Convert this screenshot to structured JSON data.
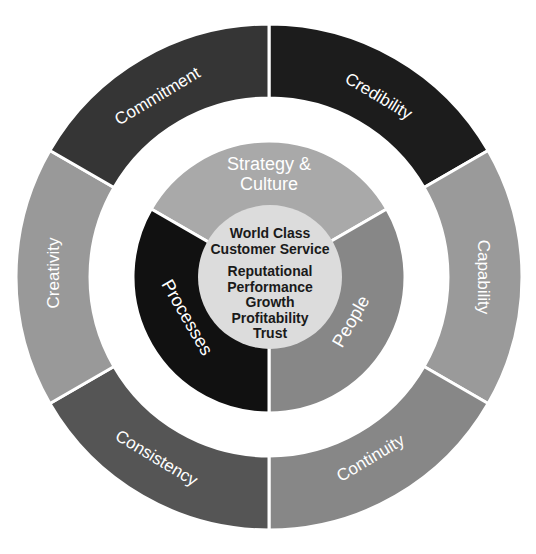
{
  "diagram": {
    "center": {
      "x": 269,
      "y": 277
    },
    "outer_ring": {
      "inner_radius": 179,
      "outer_radius": 253,
      "segments": [
        {
          "label": "Credibility",
          "start_deg": 0,
          "end_deg": 60,
          "color": "#1c1c1c",
          "label_x": 378,
          "label_y": 97,
          "label_rot": 31
        },
        {
          "label": "Capability",
          "start_deg": 60,
          "end_deg": 120,
          "color": "#9a9a9a",
          "label_x": 482,
          "label_y": 277,
          "label_rot": 90
        },
        {
          "label": "Continuity",
          "start_deg": 120,
          "end_deg": 180,
          "color": "#878787",
          "label_x": 371,
          "label_y": 459,
          "label_rot": -31
        },
        {
          "label": "Consistency",
          "start_deg": 180,
          "end_deg": 240,
          "color": "#555555",
          "label_x": 156,
          "label_y": 459,
          "label_rot": 31
        },
        {
          "label": "Creativity",
          "start_deg": 240,
          "end_deg": 300,
          "color": "#999999",
          "label_x": 55,
          "label_y": 273,
          "label_rot": -90
        },
        {
          "label": "Commitment",
          "start_deg": 300,
          "end_deg": 360,
          "color": "#353535",
          "label_x": 158,
          "label_y": 97,
          "label_rot": -31
        }
      ]
    },
    "middle_ring": {
      "radius": 136,
      "segments": [
        {
          "label_lines": [
            "Strategy &",
            "Culture"
          ],
          "start_deg": 300,
          "end_deg": 420,
          "color": "#a9a9a9"
        },
        {
          "label_lines": [
            "People"
          ],
          "start_deg": 60,
          "end_deg": 180,
          "color": "#878787",
          "label_x": 352,
          "label_y": 322,
          "label_rot": -60
        },
        {
          "label_lines": [
            "Processes"
          ],
          "start_deg": 180,
          "end_deg": 300,
          "color": "#111111",
          "label_x": 186,
          "label_y": 318,
          "label_rot": 60
        }
      ]
    },
    "core": {
      "radius": 72,
      "color": "#dcdcdc",
      "heading_lines": [
        "World Class",
        "Customer Service"
      ],
      "value_lines": [
        "Reputational",
        "Performance",
        "Growth",
        "Profitability",
        "Trust"
      ]
    },
    "labels": {
      "credibility": "Credibility",
      "capability": "Capability",
      "continuity": "Continuity",
      "consistency": "Consistency",
      "creativity": "Creativity",
      "commitment": "Commitment",
      "strategy_line1": "Strategy &",
      "strategy_line2": "Culture",
      "people": "People",
      "processes": "Processes",
      "core_heading_1": "World Class",
      "core_heading_2": "Customer Service",
      "core_value_1": "Reputational",
      "core_value_2": "Performance",
      "core_value_3": "Growth",
      "core_value_4": "Profitability",
      "core_value_5": "Trust"
    }
  }
}
